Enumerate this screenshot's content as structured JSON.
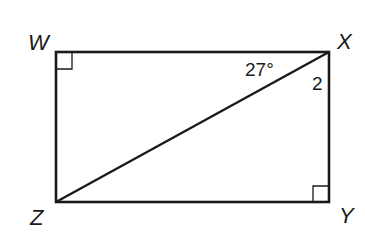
{
  "diagram": {
    "type": "rectangle-with-diagonal",
    "vertices": {
      "W": {
        "label": "W",
        "position": "top-left",
        "right_angle": true
      },
      "X": {
        "label": "X",
        "position": "top-right",
        "right_angle": false
      },
      "Y": {
        "label": "Y",
        "position": "bottom-right",
        "right_angle": true
      },
      "Z": {
        "label": "Z",
        "position": "bottom-left",
        "right_angle": false
      }
    },
    "diagonal": "XZ",
    "angles": {
      "angle_1": {
        "label": "27°",
        "at": "X",
        "between": "XW and XZ"
      },
      "angle_2": {
        "label": "2",
        "at": "X",
        "between": "XZ and XY"
      }
    },
    "stroke_color": "#1a1a1a"
  }
}
